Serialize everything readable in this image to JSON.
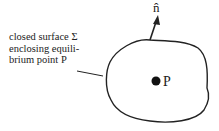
{
  "diagram": {
    "surface_label_lines": [
      "closed surface Σ",
      "enclosing equili-",
      "brium point P"
    ],
    "normal_label": "n̂",
    "point_label": "P",
    "colors": {
      "stroke": "#222222",
      "background": "#ffffff"
    }
  }
}
